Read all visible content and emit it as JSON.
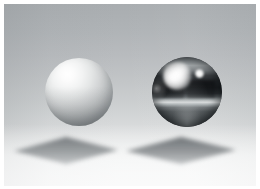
{
  "scene": {
    "title": "Two spheres on a ground plane",
    "description": "Ray-traced render of a matte white sphere and a chrome mirror sphere floating above a plane, each casting a soft square shadow",
    "canvas": {
      "width": 260,
      "height": 189
    },
    "frame": {
      "x": 4,
      "y": 4,
      "width": 252,
      "height": 182
    },
    "background": {
      "top_color": "#a9adb0",
      "bottom_color": "#f2f3f3",
      "ground_color": "#f4f5f5",
      "type": "vertical-gradient"
    },
    "objects": [
      {
        "name": "matte-sphere",
        "material": "diffuse",
        "label": "Matte sphere",
        "center_x": 79,
        "center_y": 92,
        "radius": 34,
        "base_color": "#d8dadb",
        "highlight_color": "#ffffff",
        "shadow_color": "#84888a"
      },
      {
        "name": "chrome-sphere",
        "material": "mirror",
        "label": "Chrome sphere",
        "center_x": 187,
        "center_y": 92,
        "radius": 35,
        "base_color": "#3a3d40",
        "highlight_color": "#ffffff",
        "shadow_color": "#191c1f"
      }
    ],
    "shadows": [
      {
        "name": "matte-sphere-shadow",
        "label": "Shadow of matte sphere",
        "color": "#6f7478",
        "opacity": 0.62,
        "points": "52,0 104,13 52,27 0,14"
      },
      {
        "name": "chrome-sphere-shadow",
        "label": "Shadow of chrome sphere",
        "color": "#6f7478",
        "opacity": 0.66,
        "points": "55,0 110,13 55,27 0,14"
      }
    ]
  }
}
